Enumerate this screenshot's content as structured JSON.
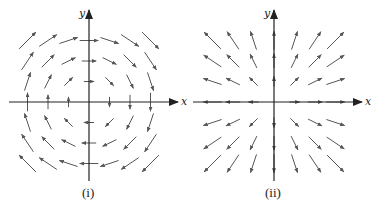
{
  "figure": {
    "panels": [
      {
        "id": "i",
        "caption": "(i)",
        "x_axis_label": "x",
        "y_axis_label": "y",
        "field_description": "rotational field F = (y, -x), clockwise circulation",
        "origin_px": [
          89,
          102
        ],
        "spacing_px": 20.5,
        "x_axis_px": [
          9,
          178
        ],
        "y_axis_px": [
          11,
          181
        ]
      },
      {
        "id": "ii",
        "caption": "(ii)",
        "x_axis_label": "x",
        "y_axis_label": "y",
        "field_description": "radial field F = (x, y), pointing away from origin",
        "origin_px": [
          274,
          102
        ],
        "spacing_px": 20.5,
        "x_axis_px": [
          193,
          362
        ],
        "y_axis_px": [
          11,
          181
        ]
      }
    ],
    "colors": {
      "axis": "#222222",
      "arrow": "#555555"
    }
  },
  "chart_data": [
    {
      "type": "vector_field",
      "title": "(i)",
      "xlabel": "x",
      "ylabel": "y",
      "grid": [
        -3,
        -2,
        -1,
        0,
        1,
        2,
        3
      ],
      "field": "F(x,y) = (y, -x)",
      "scale": 0.55,
      "legend": null
    },
    {
      "type": "vector_field",
      "title": "(ii)",
      "xlabel": "x",
      "ylabel": "y",
      "grid": [
        -3,
        -2,
        -1,
        0,
        1,
        2,
        3
      ],
      "field": "F(x,y) = (x, y)",
      "scale": 0.55,
      "legend": null
    }
  ]
}
